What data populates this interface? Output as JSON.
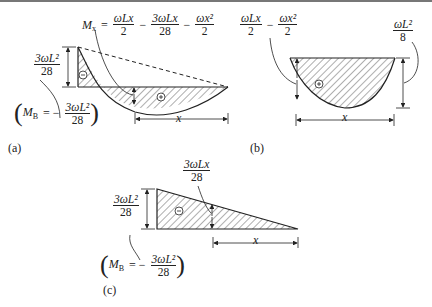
{
  "figure": {
    "panels": [
      {
        "id": "a",
        "caption": "(a)",
        "moment_label": {
          "lhs": "M",
          "lhs_sub": "x",
          "eq": "=",
          "term1_num": "ωLx",
          "term1_den": "2",
          "op1": "−",
          "term2_num": "3ωLx",
          "term2_den": "28",
          "op2": "−",
          "term3_num": "ωx²",
          "term3_den": "2"
        },
        "height_label": {
          "num": "3ωL²",
          "den": "28"
        },
        "support_moment": {
          "lhs": "M",
          "lhs_sub": "B",
          "eq": "= −",
          "num": "3ωL²",
          "den": "28"
        },
        "neg_sign": "−",
        "pos_sign": "+",
        "x_label": "x"
      },
      {
        "id": "b",
        "caption": "(b)",
        "moment_label": {
          "term1_num": "ωLx",
          "term1_den": "2",
          "op1": "−",
          "term2_num": "ωx²",
          "term2_den": "2"
        },
        "height_label": {
          "num": "ωL²",
          "den": "8"
        },
        "pos_sign": "+",
        "x_label": "x"
      },
      {
        "id": "c",
        "caption": "(c)",
        "moment_label": {
          "num": "3ωLx",
          "den": "28"
        },
        "height_label": {
          "num": "3ωL²",
          "den": "28"
        },
        "support_moment": {
          "lhs": "M",
          "lhs_sub": "B",
          "eq": "= −",
          "num": "3ωL²",
          "den": "28"
        },
        "neg_sign": "−",
        "x_label": "x"
      }
    ]
  }
}
